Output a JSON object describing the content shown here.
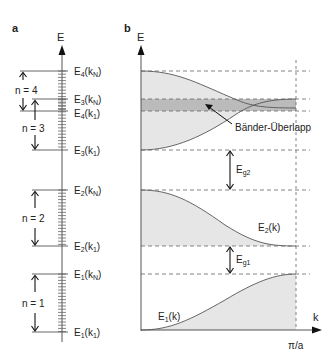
{
  "panel_a": {
    "label": "a",
    "axis_label": "E",
    "levels": [
      {
        "id": "E4kN",
        "main": "E",
        "sub": "4",
        "arg": "k",
        "argsub": "N",
        "y": 71
      },
      {
        "id": "E3kN",
        "main": "E",
        "sub": "3",
        "arg": "k",
        "argsub": "N",
        "y": 99
      },
      {
        "id": "E4k1",
        "main": "E",
        "sub": "4",
        "arg": "k",
        "argsub": "1",
        "y": 111
      },
      {
        "id": "E3k1",
        "main": "E",
        "sub": "3",
        "arg": "k",
        "argsub": "1",
        "y": 150
      },
      {
        "id": "E2kN",
        "main": "E",
        "sub": "2",
        "arg": "k",
        "argsub": "N",
        "y": 190
      },
      {
        "id": "E2k1",
        "main": "E",
        "sub": "2",
        "arg": "k",
        "argsub": "1",
        "y": 246
      },
      {
        "id": "E1kN",
        "main": "E",
        "sub": "1",
        "arg": "k",
        "argsub": "N",
        "y": 274
      },
      {
        "id": "E1k1",
        "main": "E",
        "sub": "1",
        "arg": "k",
        "argsub": "1",
        "y": 332
      }
    ],
    "bands": [
      {
        "label": "n = 4"
      },
      {
        "label": "n = 3"
      },
      {
        "label": "n = 2"
      },
      {
        "label": "n = 1"
      }
    ]
  },
  "panel_b": {
    "label": "b",
    "y_axis_label": "E",
    "x_axis_label": "k",
    "x_tick_label": "π/a",
    "curve_labels": {
      "E2": {
        "main": "E",
        "sub": "2",
        "arg": "(k)"
      },
      "E1": {
        "main": "E",
        "sub": "1",
        "arg": "(k)"
      }
    },
    "gap_labels": {
      "Eg2": {
        "main": "E",
        "sub": "g2"
      },
      "Eg1": {
        "main": "E",
        "sub": "g1"
      }
    },
    "overlap_label": "Bänder-Überlapp",
    "colors": {
      "band_fill": "#e6e6e6",
      "overlap_fill": "#b3b3b3",
      "line": "#555555",
      "dashed": "#666666"
    }
  }
}
